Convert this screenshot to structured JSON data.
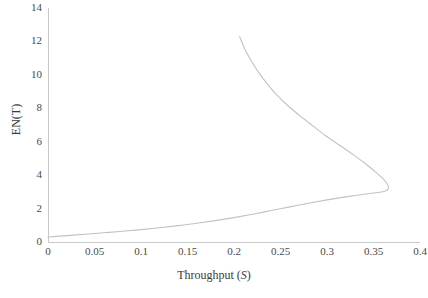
{
  "chart_data": {
    "type": "line",
    "title": "",
    "xlabel": "Throughput (S)",
    "xlabel_plain": "Throughput",
    "xlabel_symbol": "S",
    "ylabel": "EN(T)",
    "xlim": [
      0,
      0.4
    ],
    "ylim": [
      0,
      14
    ],
    "xticks": [
      0,
      0.05,
      0.1,
      0.15,
      0.2,
      0.25,
      0.3,
      0.35,
      0.4
    ],
    "xtick_labels": [
      "0",
      "0.05",
      "0.1",
      "0.15",
      "0.2",
      "0.25",
      "0.3",
      "0.35",
      "0.4"
    ],
    "yticks": [
      0,
      2,
      4,
      6,
      8,
      10,
      12,
      14
    ],
    "ytick_labels": [
      "0",
      "2",
      "4",
      "6",
      "8",
      "10",
      "12",
      "14"
    ],
    "grid": false,
    "legend": null,
    "line_color": "#c2c2c2",
    "series": [
      {
        "name": "EN(T) vs Throughput",
        "shape": "backward-bending curve with nose at maximum throughput",
        "points": [
          [
            0.0,
            0.3
          ],
          [
            0.02,
            0.38
          ],
          [
            0.04,
            0.46
          ],
          [
            0.06,
            0.55
          ],
          [
            0.08,
            0.64
          ],
          [
            0.1,
            0.74
          ],
          [
            0.12,
            0.85
          ],
          [
            0.14,
            0.98
          ],
          [
            0.16,
            1.12
          ],
          [
            0.18,
            1.28
          ],
          [
            0.2,
            1.46
          ],
          [
            0.22,
            1.66
          ],
          [
            0.24,
            1.88
          ],
          [
            0.26,
            2.1
          ],
          [
            0.28,
            2.32
          ],
          [
            0.3,
            2.52
          ],
          [
            0.32,
            2.7
          ],
          [
            0.34,
            2.86
          ],
          [
            0.355,
            2.96
          ],
          [
            0.363,
            3.05
          ],
          [
            0.366,
            3.2
          ],
          [
            0.365,
            3.45
          ],
          [
            0.36,
            3.8
          ],
          [
            0.352,
            4.2
          ],
          [
            0.342,
            4.65
          ],
          [
            0.33,
            5.15
          ],
          [
            0.316,
            5.7
          ],
          [
            0.3,
            6.3
          ],
          [
            0.286,
            6.9
          ],
          [
            0.272,
            7.5
          ],
          [
            0.258,
            8.15
          ],
          [
            0.246,
            8.8
          ],
          [
            0.236,
            9.45
          ],
          [
            0.227,
            10.1
          ],
          [
            0.219,
            10.8
          ],
          [
            0.212,
            11.5
          ],
          [
            0.206,
            12.3
          ]
        ],
        "nose_point": {
          "x": 0.366,
          "y": 3.2,
          "note": "maximum throughput turning point"
        },
        "upper_branch_end": {
          "x": 0.206,
          "y": 12.3
        },
        "lower_branch_start": {
          "x": 0.0,
          "y": 0.3
        }
      }
    ]
  }
}
